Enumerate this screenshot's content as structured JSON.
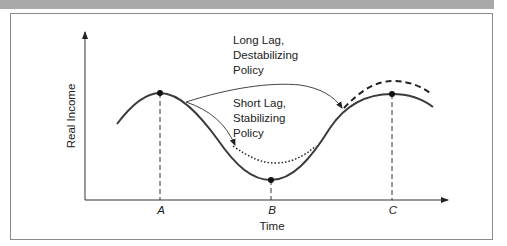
{
  "figure": {
    "y_axis_label": "Real Income",
    "x_axis_label": "Time",
    "points": [
      {
        "label": "A",
        "description": "Peak"
      },
      {
        "label": "B",
        "description": "Trough"
      },
      {
        "label": "C",
        "description": "Peak"
      }
    ],
    "annotations": {
      "long_lag": [
        "Long Lag,",
        "Destabilizing",
        "Policy"
      ],
      "short_lag": [
        "Short Lag,",
        "Stabilizing",
        "Policy"
      ]
    },
    "curves": [
      {
        "name": "business-cycle",
        "style": "solid"
      },
      {
        "name": "short-lag-stabilized-path",
        "style": "dotted"
      },
      {
        "name": "long-lag-destabilized-path",
        "style": "dashed"
      }
    ],
    "colors": {
      "line": "#333333",
      "frame": "#8a8a8a",
      "band": "#a9a9a9"
    }
  }
}
